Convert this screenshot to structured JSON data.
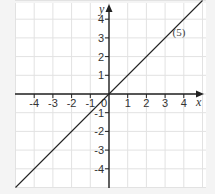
{
  "chart_data": {
    "type": "line",
    "title": "",
    "xlabel": "x",
    "ylabel": "y",
    "xlim": [
      -5,
      5
    ],
    "ylim": [
      -5,
      5
    ],
    "grid": true,
    "x_ticks": [
      "-4",
      "-3",
      "-2",
      "-1",
      "0",
      "1",
      "2",
      "3",
      "4"
    ],
    "y_ticks": [
      "4",
      "3",
      "2",
      "1",
      "-1",
      "-2",
      "-3",
      "-4"
    ],
    "series": [
      {
        "name": "(5)",
        "equation": "y = x",
        "x": [
          -5,
          5
        ],
        "y": [
          -5,
          5
        ]
      }
    ],
    "annotations": [
      {
        "text": "(5)",
        "x": 3.4,
        "y": 3.1
      }
    ]
  }
}
